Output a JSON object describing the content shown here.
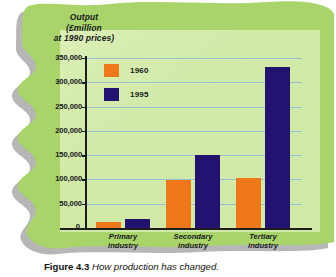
{
  "figure": {
    "caption_number": "Figure 4.3",
    "caption_text": "How production has changed."
  },
  "axis_title": {
    "line1": "Output",
    "line2": "(£million",
    "line3": "at 1990 prices)"
  },
  "colors": {
    "series_1960": "#F07818",
    "series_1995": "#241270",
    "blob_green": "#A8D46A",
    "plot_green": "#D5EBAC",
    "gridline": "#8FB8D8",
    "shadow": "#A9A9A9",
    "axis": "#1D1D1D"
  },
  "chart_data": {
    "type": "bar",
    "title": "How production has changed.",
    "xlabel": "",
    "ylabel": "Output (£million at 1990 prices)",
    "ylim": [
      0,
      350000
    ],
    "grid": true,
    "legend_position": "top-left-inside",
    "categories": [
      "Primary industry",
      "Secondary industry",
      "Tertiary industry"
    ],
    "category_lines": [
      [
        "Primary",
        "industry"
      ],
      [
        "Secondary",
        "industry"
      ],
      [
        "Tertiary",
        "industry"
      ]
    ],
    "ytick_labels": [
      "350,000",
      "300,000",
      "250,000",
      "200,000",
      "150,000",
      "100,000",
      "50,000",
      "0"
    ],
    "ytick_values": [
      350000,
      300000,
      250000,
      200000,
      150000,
      100000,
      50000,
      0
    ],
    "series": [
      {
        "name": "1960",
        "color": "#F07818",
        "values": [
          12000,
          99000,
          103000
        ]
      },
      {
        "name": "1995",
        "color": "#241270",
        "values": [
          18000,
          150000,
          332000
        ]
      }
    ]
  }
}
